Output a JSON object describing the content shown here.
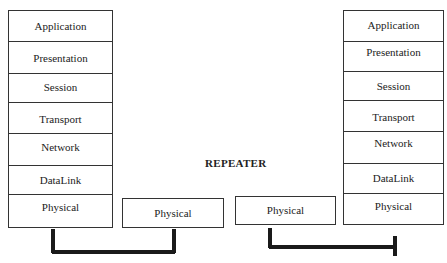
{
  "diagram": {
    "title": "REPEATER",
    "left_stack": {
      "layers": [
        "Application",
        "Presentation",
        "Session",
        "Transport",
        "Network",
        "DataLink",
        "Physical"
      ]
    },
    "right_stack": {
      "layers": [
        "Application",
        "Presentation",
        "Session",
        "Transport",
        "Network",
        "DataLink",
        "Physical"
      ]
    },
    "repeater": {
      "left_port": "Physical",
      "right_port": "Physical"
    }
  }
}
